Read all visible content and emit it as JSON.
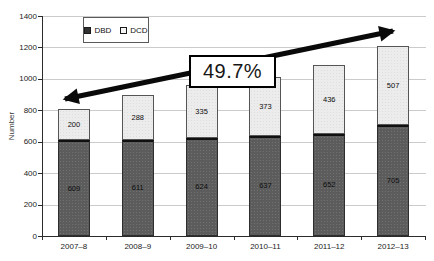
{
  "chart_data": {
    "type": "bar",
    "stacked": true,
    "categories": [
      "2007–8",
      "2008–9",
      "2009–10",
      "2010–11",
      "2011–12",
      "2012–13"
    ],
    "series": [
      {
        "name": "DBD",
        "values": [
          609,
          611,
          624,
          637,
          652,
          705
        ],
        "color": "#5c5c5c"
      },
      {
        "name": "DCD",
        "values": [
          200,
          288,
          335,
          373,
          436,
          507
        ],
        "color": "#ececec"
      }
    ],
    "title": "",
    "xlabel": "",
    "ylabel": "Number",
    "ylim": [
      0,
      1400
    ],
    "ytick_step": 200,
    "yticks": [
      0,
      200,
      400,
      600,
      800,
      1000,
      1200,
      1400
    ],
    "grid": "horizontal",
    "legend_position": "top-inside",
    "value_labels": "inside-segments",
    "annotation": {
      "label": "49.7%",
      "shape": "double-headed-arrow",
      "arrow_color": "#0a0a0a",
      "description": "thick rising arrow across the chart from lower-left to upper-right"
    },
    "colors": {
      "dbd_fill": "#5c5c5c",
      "dcd_fill": "#ececec",
      "grid": "#cbcbcb",
      "axis": "#2b2b2b",
      "background": "#ffffff"
    }
  }
}
